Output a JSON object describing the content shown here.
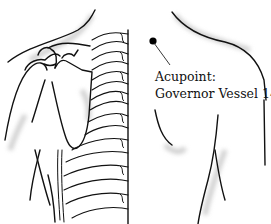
{
  "figure": {
    "annotation": {
      "title": "Acupoint:",
      "name": "Governor Vessel 14"
    },
    "marker": {
      "color": "#000000"
    },
    "colors": {
      "line": "#111111",
      "shade": "#c8c8c8",
      "background": "#ffffff"
    }
  }
}
